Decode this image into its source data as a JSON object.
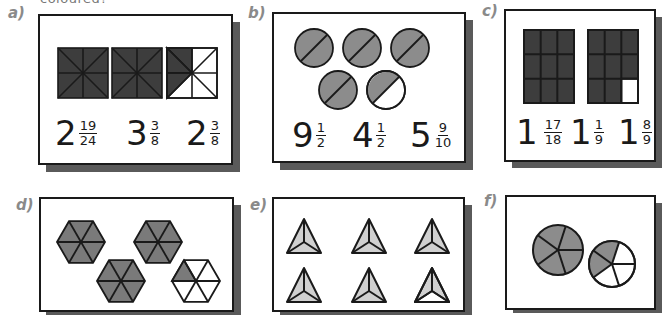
{
  "header_cut_text": "coloured?",
  "colors": {
    "dark_fill": "#3d3d3d",
    "medium_fill": "#8c8c8c",
    "light_fill": "#cfcfcf",
    "shadow": "#5a5a5a",
    "label": "#8a8a8a",
    "stroke": "#1a1a1a"
  },
  "panels": [
    {
      "label": "a)",
      "shape": "square divided into 8 triangles",
      "shaded": "2 whole squares + 3/8 of third",
      "options": [
        {
          "whole": "2",
          "num": "19",
          "den": "24"
        },
        {
          "whole": "3",
          "num": "3",
          "den": "8"
        },
        {
          "whole": "2",
          "num": "3",
          "den": "8"
        }
      ]
    },
    {
      "label": "b)",
      "shape": "circle divided into halves",
      "shaded": "4 whole circles + 1/2 of fifth",
      "options": [
        {
          "whole": "9",
          "num": "1",
          "den": "2"
        },
        {
          "whole": "4",
          "num": "1",
          "den": "2"
        },
        {
          "whole": "5",
          "num": "9",
          "den": "10"
        }
      ]
    },
    {
      "label": "c)",
      "shape": "rectangle divided into 9 parts",
      "shaded": "1 whole + 8/9",
      "options": [
        {
          "whole": "1",
          "num": "17",
          "den": "18"
        },
        {
          "whole": "1",
          "num": "1",
          "den": "9"
        },
        {
          "whole": "1",
          "num": "8",
          "den": "9"
        }
      ]
    },
    {
      "label": "d)",
      "shape": "hexagon divided into 6 triangles",
      "shaded": "3 whole hexagons + 1/6 of fourth"
    },
    {
      "label": "e)",
      "shape": "triangle divided into 3 parts",
      "shaded": "5 whole triangles + 2/3 of sixth"
    },
    {
      "label": "f)",
      "shape": "circle divided into 5 parts",
      "shaded": "1 whole circle + 2/5 of second"
    }
  ]
}
